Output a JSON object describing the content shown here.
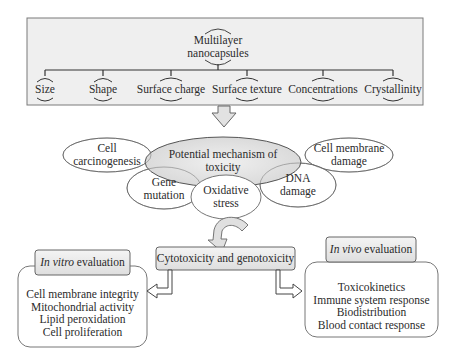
{
  "root": {
    "line1": "Multilayer",
    "line2": "nanocapsules"
  },
  "properties": [
    {
      "label": "Size"
    },
    {
      "label": "Shape"
    },
    {
      "label": "Surface charge"
    },
    {
      "label": "Surface texture"
    },
    {
      "label": "Concentrations"
    },
    {
      "label": "Crystallinity"
    }
  ],
  "mechanism": {
    "center": {
      "line1": "Potential mechanism of",
      "line2": "toxicity"
    },
    "cell_carcinogenesis": {
      "line1": "Cell",
      "line2": "carcinogenesis"
    },
    "cell_membrane_damage": {
      "line1": "Cell membrane",
      "line2": "damage"
    },
    "gene_mutation": {
      "line1": "Gene",
      "line2": "mutation"
    },
    "oxidative_stress": {
      "line1": "Oxidative",
      "line2": "stress"
    },
    "dna_damage": {
      "line1": "DNA",
      "line2": "damage"
    }
  },
  "cytotoxicity": {
    "label": "Cytotoxicity and genotoxicity"
  },
  "in_vitro": {
    "title_italic": "In vitro",
    "title_rest": " evaluation",
    "items": [
      "Cell membrane integrity",
      "Mitochondrial activity",
      "Lipid peroxidation",
      "Cell proliferation"
    ]
  },
  "in_vivo": {
    "title_italic": "In vivo",
    "title_rest": " evaluation",
    "items": [
      "Toxicokinetics",
      "Immune system response",
      "Biodistribution",
      "Blood contact response"
    ]
  },
  "colors": {
    "box_fill": "#efefef",
    "ellipse_fill": "#e6e6e6",
    "stroke": "#555555",
    "arrow_fill": "#dcdcdc"
  }
}
